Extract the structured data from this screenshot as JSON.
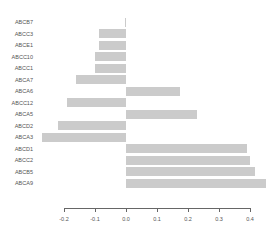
{
  "chart_data": {
    "type": "bar",
    "orientation": "horizontal",
    "title": "",
    "xlabel": "",
    "ylabel": "",
    "xlim": [
      -0.2,
      0.4
    ],
    "x_ticks": [
      "-0.2",
      "-0.1",
      "0.0",
      "0.1",
      "0.2",
      "0.3",
      "0.4"
    ],
    "grid": false,
    "legend": null,
    "bar_color": "#cbcbcb",
    "categories": [
      "ABCB7",
      "ABCC3",
      "ABCE1",
      "ABCC10",
      "ABCC1",
      "ABCA7",
      "ABCA6",
      "ABCC12",
      "ABCA5",
      "ABCD2",
      "ABCA3",
      "ABCD1",
      "ABCC2",
      "ABCB5",
      "ABCA9"
    ],
    "values": [
      -0.003,
      -0.087,
      -0.087,
      -0.1,
      -0.1,
      -0.16,
      0.175,
      -0.19,
      0.23,
      -0.22,
      -0.27,
      0.39,
      0.4,
      0.415,
      0.45
    ]
  }
}
